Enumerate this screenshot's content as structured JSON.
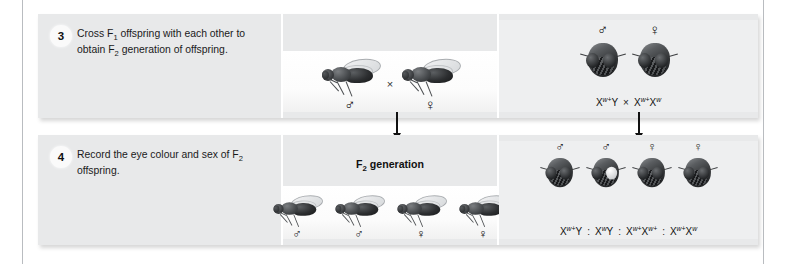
{
  "steps": [
    {
      "number": "3",
      "caption_html": "Cross F<sub>1</sub> offspring with each other to obtain F<sub>2</sub> generation of offspring.",
      "caption_text": "Cross F1 offspring with each other to obtain F2 generation of offspring.",
      "middle": {
        "flies": [
          {
            "sex_symbol": "♂",
            "sex_name": "male",
            "eye": "red",
            "view": "side"
          },
          {
            "sex_symbol": "♀",
            "sex_name": "female",
            "eye": "red",
            "view": "side"
          }
        ],
        "cross_symbol": "×"
      },
      "right": {
        "flies": [
          {
            "sex_symbol": "♂",
            "sex_name": "male",
            "eye": "red",
            "view": "front"
          },
          {
            "sex_symbol": "♀",
            "sex_name": "female",
            "eye": "red",
            "view": "front"
          }
        ],
        "cross_symbol": "×",
        "genotypes": [
          {
            "allele1": "X",
            "sup1": "w+",
            "allele2": "Y",
            "sup2": ""
          },
          {
            "allele1": "X",
            "sup1": "w+",
            "allele2": "X",
            "sup2": "w"
          }
        ]
      }
    },
    {
      "number": "4",
      "caption_html": "Record the eye colour and sex of F<sub>2</sub> offspring.",
      "caption_text": "Record the eye colour and sex of F2 offspring.",
      "middle": {
        "title_html": "F<sub>2</sub> generation",
        "title_text": "F2 generation",
        "flies": [
          {
            "sex_symbol": "♂",
            "sex_name": "male",
            "eye": "red",
            "view": "side"
          },
          {
            "sex_symbol": "♂",
            "sex_name": "male",
            "eye": "red",
            "view": "side"
          },
          {
            "sex_symbol": "♀",
            "sex_name": "female",
            "eye": "red",
            "view": "side"
          },
          {
            "sex_symbol": "♀",
            "sex_name": "female",
            "eye": "red",
            "view": "side"
          }
        ]
      },
      "right": {
        "flies": [
          {
            "sex_symbol": "♂",
            "sex_name": "male",
            "eye": "red",
            "view": "front"
          },
          {
            "sex_symbol": "♂",
            "sex_name": "male",
            "eye": "white",
            "view": "front"
          },
          {
            "sex_symbol": "♀",
            "sex_name": "female",
            "eye": "red",
            "view": "front"
          },
          {
            "sex_symbol": "♀",
            "sex_name": "female",
            "eye": "red",
            "view": "front"
          }
        ],
        "ratio_separator": ":",
        "genotypes": [
          {
            "allele1": "X",
            "sup1": "w+",
            "allele2": "Y",
            "sup2": ""
          },
          {
            "allele1": "X",
            "sup1": "w",
            "allele2": "Y",
            "sup2": ""
          },
          {
            "allele1": "X",
            "sup1": "w+",
            "allele2": "X",
            "sup2": "w+"
          },
          {
            "allele1": "X",
            "sup1": "w+",
            "allele2": "X",
            "sup2": "w"
          }
        ]
      }
    }
  ],
  "arrows": [
    {
      "name": "arrow-middle",
      "direction": "down"
    },
    {
      "name": "arrow-right",
      "direction": "down"
    }
  ],
  "colors": {
    "panel_background": "#e8e9ea",
    "stage_background": "#ffffff",
    "text": "#1a1a1a",
    "rule": "#b9bcc0",
    "fly_red_eye": "#232527",
    "fly_white_eye": "#ffffff"
  }
}
